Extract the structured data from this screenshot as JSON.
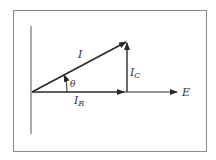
{
  "diagram": {
    "colors": {
      "frame": "#8a8a8a",
      "line": "#2a2a2a",
      "text": "#333333",
      "background": "#ffffff"
    },
    "labels": {
      "total_current": "I",
      "theta": "θ",
      "capacitive_current": "I",
      "capacitive_subscript": "C",
      "resistive_current": "I",
      "resistive_subscript": "R",
      "voltage": "E"
    },
    "vectors": [
      {
        "name": "I",
        "from": [
          32,
          92
        ],
        "to": [
          126,
          42
        ]
      },
      {
        "name": "I_R",
        "from": [
          32,
          92
        ],
        "to": [
          124,
          92
        ]
      },
      {
        "name": "I_C",
        "from": [
          127,
          92
        ],
        "to": [
          127,
          43
        ]
      },
      {
        "name": "E",
        "from": [
          124,
          92
        ],
        "to": [
          177,
          92
        ]
      }
    ]
  }
}
